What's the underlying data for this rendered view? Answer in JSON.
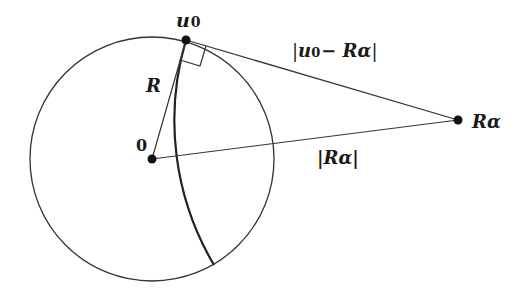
{
  "diagram": {
    "colors": {
      "stroke": "#333333",
      "point": "#111111",
      "background": "#ffffff"
    },
    "circle": {
      "cx": 152,
      "cy": 159,
      "r": 122
    },
    "points": [
      {
        "id": "origin",
        "label": "0",
        "x": 152,
        "y": 159
      },
      {
        "id": "u0",
        "label_base": "u",
        "label_sub": "0",
        "x": 186,
        "y": 40
      },
      {
        "id": "R_alpha",
        "label": "Rα",
        "x": 458,
        "y": 120
      }
    ],
    "labels": {
      "origin": "0",
      "u0_base": "u",
      "u0_sub": "0",
      "radius": "R",
      "R_alpha": "Rα",
      "dist_u0_Ralpha_open": "|",
      "dist_u0_Ralpha_u": "u",
      "dist_u0_Ralpha_sub": "0",
      "dist_u0_Ralpha_rest": "− Rα",
      "dist_u0_Ralpha_close": "|",
      "dist_Ralpha": "|Rα|"
    },
    "segments": [
      {
        "from": "origin",
        "to": "u0",
        "label": "R"
      },
      {
        "from": "u0",
        "to": "R_alpha",
        "label": "|u0 − Rα|"
      },
      {
        "from": "origin",
        "to": "R_alpha",
        "label": "|Rα|"
      }
    ],
    "orthogonal_arc": {
      "center": "R_alpha",
      "radius": 283.5,
      "from": [
        186,
        40
      ],
      "to": [
        214,
        265
      ]
    },
    "right_angle_marker": {
      "at": "u0",
      "size": 21
    }
  }
}
